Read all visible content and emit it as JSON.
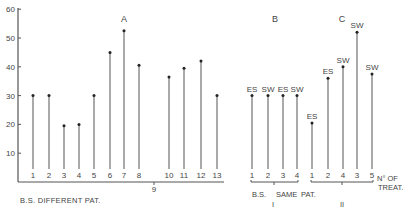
{
  "chart_data": {
    "type": "bar",
    "style": "lollipop",
    "ylabel": "",
    "ylim": [
      0,
      60
    ],
    "yticks": [
      10,
      20,
      30,
      40,
      50,
      60
    ],
    "groups": [
      {
        "id": "A",
        "label": "A",
        "xlabel": "B.S. DIFFERENT PAT.",
        "categories": [
          "1",
          "2",
          "3",
          "4",
          "5",
          "6",
          "7",
          "8",
          "9",
          "10",
          "11",
          "12",
          "13"
        ],
        "values": [
          30,
          30,
          19.5,
          20,
          30,
          45,
          52.5,
          40.5,
          null,
          36.5,
          39.5,
          42,
          30
        ],
        "annotations": []
      },
      {
        "id": "B",
        "label": "B",
        "xlabel": "B.S.   SAME  PAT.",
        "sublabel": "I",
        "categories": [
          "1",
          "2",
          "3",
          "4"
        ],
        "values": [
          30,
          30,
          30,
          30
        ],
        "annotations": [
          "ES",
          "SW",
          "ES",
          "SW"
        ]
      },
      {
        "id": "C",
        "label": "C",
        "sublabel": "II",
        "categories": [
          "1",
          "2",
          "4",
          "3",
          "5"
        ],
        "values": [
          20.5,
          36,
          40,
          52,
          37.5
        ],
        "annotations": [
          "ES",
          "ES",
          "SW",
          "SW",
          "SW"
        ]
      }
    ],
    "x_axis_note": [
      "N° OF",
      "TREAT."
    ],
    "grid": false
  },
  "labels": {
    "group_a": "A",
    "group_b": "B",
    "group_c": "C",
    "xlabel_a": "B.S. DIFFERENT PAT.",
    "xlabel_bs": "B.S.",
    "xlabel_same": "SAME",
    "xlabel_pat": "PAT.",
    "roman_i": "I",
    "roman_ii": "II",
    "treat_line1": "N° OF",
    "treat_line2": "TREAT."
  }
}
